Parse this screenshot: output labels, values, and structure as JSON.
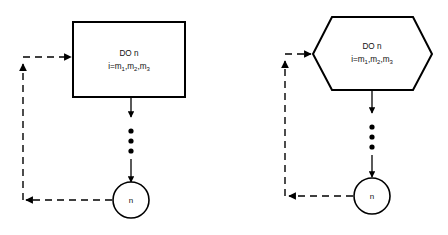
{
  "figure": {
    "type": "flowchart",
    "background_color": "#ffffff",
    "stroke_color": "#000000",
    "panels": [
      {
        "id": "left-panel",
        "name": "rectangle-variant",
        "shape": "rectangle",
        "process_text_line1": "DO n",
        "process_text_line2_prefix": "i=m",
        "process_text_subscripts": [
          "1",
          "2",
          "3"
        ],
        "process_text_line2_full": "i=m1,m2,m3",
        "terminal_label": "n",
        "ellipsis_dots": 3,
        "loop_back_style": "dashed",
        "forward_style": "solid"
      },
      {
        "id": "right-panel",
        "name": "hexagon-variant",
        "shape": "hexagon",
        "process_text_line1": "DO n",
        "process_text_line2_prefix": "i=m",
        "process_text_subscripts": [
          "1",
          "2",
          "3"
        ],
        "process_text_line2_full": "i=m1,m2,m3",
        "terminal_label": "n",
        "ellipsis_dots": 3,
        "loop_back_style": "dashed",
        "forward_style": "solid"
      }
    ]
  }
}
